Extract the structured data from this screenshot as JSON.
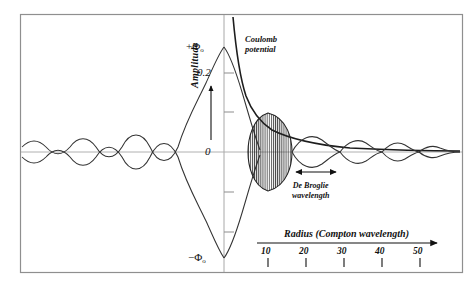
{
  "figure": {
    "background": "#ffffff",
    "frame_color": "#8a8a8a",
    "curve_color": "#2b2b2b",
    "zero_line_color": "#aaaaaa",
    "axis_color": "#999999"
  },
  "labels": {
    "amplitude_axis": "Amplitude",
    "y_top": "+Φ",
    "y_top_sub": "o",
    "y_bottom": "−Φ",
    "y_bottom_sub": "o",
    "y_tick_02": "0.2",
    "y_tick_zero": "0",
    "coulomb_line1": "Coulomb",
    "coulomb_line2": "potential",
    "debroglie_line1": "De Broglie",
    "debroglie_line2": "wavelength",
    "radius_axis": "Radius  (Compton wavelength)"
  },
  "chart_data": {
    "type": "line",
    "title": "",
    "xlabel": "Radius  (Compton wavelength)",
    "ylabel": "Amplitude",
    "grid": false,
    "legend": "none",
    "x_ticks": [
      10,
      20,
      30,
      40,
      50
    ],
    "x_tick_labels": [
      "10",
      "20",
      "30",
      "40",
      "50"
    ],
    "y_tick_labels": [
      "+Φo",
      "0.2",
      "0",
      "−Φo"
    ],
    "y_tick_values": [
      1.0,
      0.2,
      0.0,
      -1.0
    ],
    "ylim": [
      -1.1,
      1.1
    ],
    "xlim": [
      -55,
      58
    ],
    "series": [
      {
        "name": "Coulomb potential",
        "type": "envelope-hyperbola",
        "description": "1/r decay from axis, acts as upper envelope of the oscillation on the right",
        "annotation": "Coulomb potential"
      },
      {
        "name": "Wave amplitude",
        "type": "damped-oscillation",
        "description": "Oscillating wave with lens-shaped envelopes, peaking at +Φo / -Φo at the origin and decaying outward on both sides"
      }
    ],
    "annotations": [
      {
        "text": "Coulomb potential",
        "x": 14,
        "y": 0.85
      },
      {
        "text": "De Broglie wavelength",
        "x": 24,
        "y": -0.28,
        "marker": "double-arrow"
      }
    ]
  },
  "x_axis_scale": {
    "ticks": [
      {
        "label": "10",
        "px": 268
      },
      {
        "label": "20",
        "px": 306
      },
      {
        "label": "30",
        "px": 344
      },
      {
        "label": "40",
        "px": 382
      },
      {
        "label": "50",
        "px": 420
      }
    ],
    "arrow_end_px": 437
  }
}
